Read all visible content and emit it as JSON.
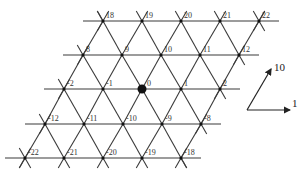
{
  "diagram": {
    "type": "triangular-lattice",
    "line_color": "#3a3a3a",
    "node_color": "#111111",
    "origin_node": "0",
    "rows": [
      {
        "y": 21,
        "nodes": [
          {
            "label": "18",
            "x": 103
          },
          {
            "label": "19",
            "x": 142
          },
          {
            "label": "20",
            "x": 181
          },
          {
            "label": "21",
            "x": 220
          },
          {
            "label": "22",
            "x": 259
          }
        ]
      },
      {
        "y": 55,
        "nodes": [
          {
            "label": "8",
            "x": 83
          },
          {
            "label": "9",
            "x": 122
          },
          {
            "label": "10",
            "x": 161
          },
          {
            "label": "11",
            "x": 200
          },
          {
            "label": "12",
            "x": 239
          }
        ]
      },
      {
        "y": 89,
        "nodes": [
          {
            "label": "-2",
            "x": 64
          },
          {
            "label": "-1",
            "x": 103
          },
          {
            "label": "0",
            "x": 142
          },
          {
            "label": "1",
            "x": 181
          },
          {
            "label": "2",
            "x": 220
          }
        ]
      },
      {
        "y": 124,
        "nodes": [
          {
            "label": "-12",
            "x": 45
          },
          {
            "label": "-11",
            "x": 84
          },
          {
            "label": "-10",
            "x": 123
          },
          {
            "label": "-9",
            "x": 162
          },
          {
            "label": "-8",
            "x": 201
          }
        ]
      },
      {
        "y": 158,
        "nodes": [
          {
            "label": "-22",
            "x": 25
          },
          {
            "label": "-21",
            "x": 64
          },
          {
            "label": "-20",
            "x": 103
          },
          {
            "label": "-19",
            "x": 142
          },
          {
            "label": "-18",
            "x": 181
          }
        ]
      }
    ],
    "basis": {
      "origin": [
        247,
        110
      ],
      "vectors": [
        {
          "label": "1",
          "to": [
            290,
            110
          ],
          "label_pos": [
            292,
            98
          ]
        },
        {
          "label": "10",
          "to": [
            271,
            69
          ],
          "label_pos": [
            274,
            62
          ]
        }
      ]
    }
  }
}
